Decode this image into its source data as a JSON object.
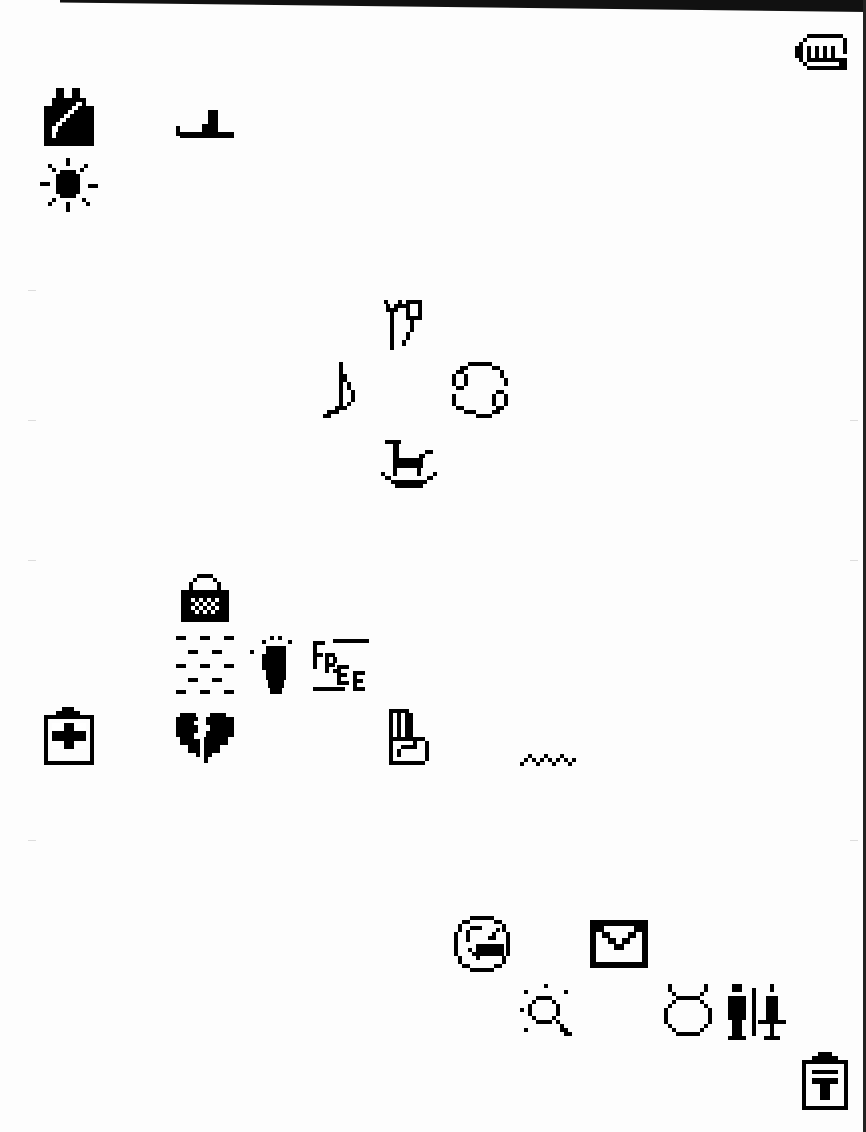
{
  "sheet": {
    "description": "Pixel icon glyph sheet",
    "icons": [
      {
        "name": "fist-icon",
        "x": 795,
        "y": 34
      },
      {
        "name": "vest-icon",
        "x": 44,
        "y": 88
      },
      {
        "name": "boot-icon",
        "x": 176,
        "y": 110
      },
      {
        "name": "sun-icon",
        "x": 40,
        "y": 158
      },
      {
        "name": "capricorn-icon",
        "x": 382,
        "y": 300
      },
      {
        "name": "eighth-note-icon",
        "x": 323,
        "y": 362
      },
      {
        "name": "cancer-icon",
        "x": 452,
        "y": 362
      },
      {
        "name": "rocking-horse-icon",
        "x": 381,
        "y": 440
      },
      {
        "name": "handbag-icon",
        "x": 181,
        "y": 574
      },
      {
        "name": "brick-pattern-icon",
        "x": 176,
        "y": 636
      },
      {
        "name": "footprint-icon",
        "x": 250,
        "y": 636
      },
      {
        "name": "free-icon",
        "x": 313,
        "y": 637
      },
      {
        "name": "medical-clipboard-icon",
        "x": 44,
        "y": 707
      },
      {
        "name": "broken-heart-icon",
        "x": 176,
        "y": 713
      },
      {
        "name": "peace-hand-icon",
        "x": 389,
        "y": 709
      },
      {
        "name": "zigzag-icon",
        "x": 520,
        "y": 750
      },
      {
        "name": "no-smoking-icon",
        "x": 452,
        "y": 916
      },
      {
        "name": "envelope-icon",
        "x": 590,
        "y": 920
      },
      {
        "name": "sparkle-magnifier-icon",
        "x": 520,
        "y": 984
      },
      {
        "name": "taurus-icon",
        "x": 664,
        "y": 984
      },
      {
        "name": "restroom-icon",
        "x": 726,
        "y": 984
      },
      {
        "name": "postbox-icon",
        "x": 802,
        "y": 1052
      }
    ]
  }
}
